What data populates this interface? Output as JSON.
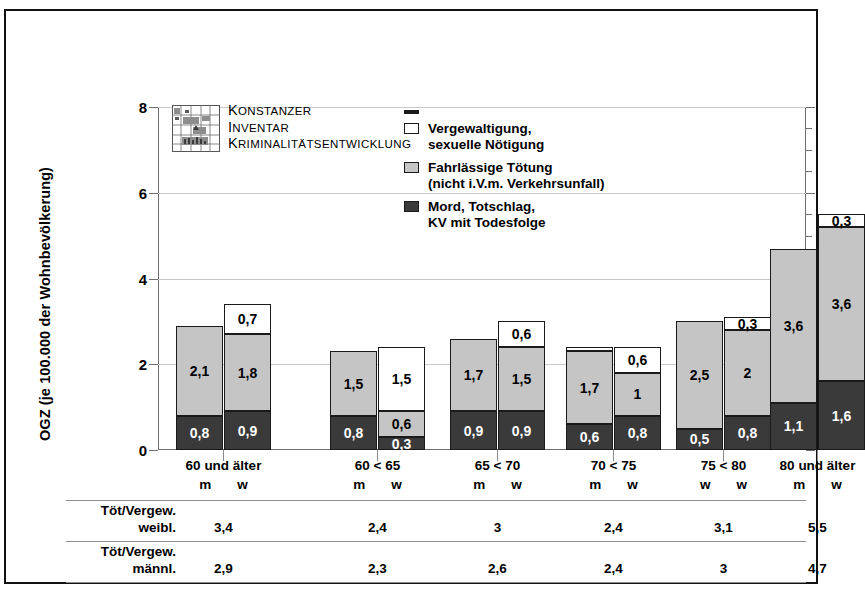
{
  "axis": {
    "y_title": "OGZ (je 100.000 der Wohnbevölkerung)",
    "y_ticks": [
      "0",
      "2",
      "4",
      "6",
      "8"
    ]
  },
  "kik_logo": {
    "line1_cap": "K",
    "line1_rest": "ONSTANZER",
    "line2_cap": "I",
    "line2_rest": "NVENTAR",
    "line3_cap": "K",
    "line3_rest": "RIMINALITÄTSENTWICKLUNG",
    "icon": "kik-map-logo"
  },
  "legend": {
    "items": [
      {
        "swatch": "dash-marker",
        "line1": "",
        "line2": ""
      },
      {
        "swatch": "white-square",
        "line1": "Vergewaltigung,",
        "line2": "sexuelle Nötigung"
      },
      {
        "swatch": "gray-square",
        "line1": "Fahrlässige Tötung",
        "line2": "(nicht i.V.m. Verkehrsunfall)"
      },
      {
        "swatch": "dark-square",
        "line1": "Mord, Totschlag,",
        "line2": "KV mit Todesfolge"
      }
    ]
  },
  "table": {
    "row1_label_line1": "Töt/Vergew.",
    "row1_label_line2": "weibl.",
    "row1_values": [
      "3,4",
      "2,4",
      "3",
      "2,4",
      "3,1",
      "5,5"
    ],
    "row2_label_line1": "Töt/Vergew.",
    "row2_label_line2": "männl.",
    "row2_values": [
      "2,9",
      "2,3",
      "2,6",
      "2,4",
      "3",
      "4,7"
    ]
  },
  "chart_data": {
    "type": "bar",
    "title": "",
    "xlabel": "",
    "ylabel": "OGZ (je 100.000 der Wohnbevölkerung)",
    "ylim": [
      0,
      8
    ],
    "yticks": [
      0,
      2,
      4,
      6,
      8
    ],
    "grid": true,
    "stacked": true,
    "legend_position": "inside-top",
    "series": [
      {
        "name": "Mord, Totschlag, KV mit Todesfolge",
        "color": "#3a3a3a"
      },
      {
        "name": "Fahrlässige Tötung (nicht i.V.m. Verkehrsunfall)",
        "color": "#c5c5c5"
      },
      {
        "name": "Vergewaltigung, sexuelle Nötigung",
        "color": "#ffffff"
      }
    ],
    "groups": [
      {
        "category": "60 und älter",
        "bars": [
          {
            "sex": "m",
            "total": 2.9,
            "segments": [
              {
                "series": "Mord, Totschlag, KV mit Todesfolge",
                "value": 0.8,
                "label": "0,8"
              },
              {
                "series": "Fahrlässige Tötung (nicht i.V.m. Verkehrsunfall)",
                "value": 2.1,
                "label": "2,1"
              }
            ]
          },
          {
            "sex": "w",
            "total": 3.4,
            "segments": [
              {
                "series": "Mord, Totschlag, KV mit Todesfolge",
                "value": 0.9,
                "label": "0,9"
              },
              {
                "series": "Fahrlässige Tötung (nicht i.V.m. Verkehrsunfall)",
                "value": 1.8,
                "label": "1,8"
              },
              {
                "series": "Vergewaltigung, sexuelle Nötigung",
                "value": 0.7,
                "label": "0,7"
              }
            ]
          }
        ]
      },
      {
        "category": "60 < 65",
        "bars": [
          {
            "sex": "m",
            "total": 2.3,
            "segments": [
              {
                "series": "Mord, Totschlag, KV mit Todesfolge",
                "value": 0.8,
                "label": "0,8"
              },
              {
                "series": "Fahrlässige Tötung (nicht i.V.m. Verkehrsunfall)",
                "value": 1.5,
                "label": "1,5"
              }
            ]
          },
          {
            "sex": "w",
            "total": 2.4,
            "segments": [
              {
                "series": "Mord, Totschlag, KV mit Todesfolge",
                "value": 0.3,
                "label": "0,3"
              },
              {
                "series": "Fahrlässige Tötung (nicht i.V.m. Verkehrsunfall)",
                "value": 0.6,
                "label": "0,6"
              },
              {
                "series": "Vergewaltigung, sexuelle Nötigung",
                "value": 1.5,
                "label": "1,5"
              }
            ]
          }
        ]
      },
      {
        "category": "65 < 70",
        "bars": [
          {
            "sex": "m",
            "total": 2.6,
            "segments": [
              {
                "series": "Mord, Totschlag, KV mit Todesfolge",
                "value": 0.9,
                "label": "0,9"
              },
              {
                "series": "Fahrlässige Tötung (nicht i.V.m. Verkehrsunfall)",
                "value": 1.7,
                "label": "1,7"
              }
            ]
          },
          {
            "sex": "w",
            "total": 3.0,
            "segments": [
              {
                "series": "Mord, Totschlag, KV mit Todesfolge",
                "value": 0.9,
                "label": "0,9"
              },
              {
                "series": "Fahrlässige Tötung (nicht i.V.m. Verkehrsunfall)",
                "value": 1.5,
                "label": "1,5"
              },
              {
                "series": "Vergewaltigung, sexuelle Nötigung",
                "value": 0.6,
                "label": "0,6"
              }
            ]
          }
        ]
      },
      {
        "category": "70 < 75",
        "bars": [
          {
            "sex": "m",
            "total": 2.4,
            "segments": [
              {
                "series": "Mord, Totschlag, KV mit Todesfolge",
                "value": 0.6,
                "label": "0,6"
              },
              {
                "series": "Fahrlässige Tötung (nicht i.V.m. Verkehrsunfall)",
                "value": 1.7,
                "label": "1,7"
              },
              {
                "series": "Vergewaltigung, sexuelle Nötigung",
                "value": 0.1,
                "label": ""
              }
            ]
          },
          {
            "sex": "w",
            "total": 2.4,
            "segments": [
              {
                "series": "Mord, Totschlag, KV mit Todesfolge",
                "value": 0.8,
                "label": "0,8"
              },
              {
                "series": "Fahrlässige Tötung (nicht i.V.m. Verkehrsunfall)",
                "value": 1.0,
                "label": "1"
              },
              {
                "series": "Vergewaltigung, sexuelle Nötigung",
                "value": 0.6,
                "label": "0,6"
              }
            ]
          }
        ]
      },
      {
        "category": "75 < 80",
        "bars": [
          {
            "sex": "w",
            "total": 3.0,
            "segments": [
              {
                "series": "Mord, Totschlag, KV mit Todesfolge",
                "value": 0.5,
                "label": "0,5"
              },
              {
                "series": "Fahrlässige Tötung (nicht i.V.m. Verkehrsunfall)",
                "value": 2.5,
                "label": "2,5"
              }
            ]
          },
          {
            "sex": "w",
            "total": 3.1,
            "segments": [
              {
                "series": "Mord, Totschlag, KV mit Todesfolge",
                "value": 0.8,
                "label": "0,8"
              },
              {
                "series": "Fahrlässige Tötung (nicht i.V.m. Verkehrsunfall)",
                "value": 2.0,
                "label": "2"
              },
              {
                "series": "Vergewaltigung, sexuelle Nötigung",
                "value": 0.3,
                "label": "0,3"
              }
            ]
          }
        ]
      },
      {
        "category": "80 und älter",
        "bars": [
          {
            "sex": "m",
            "total": 4.7,
            "segments": [
              {
                "series": "Mord, Totschlag, KV mit Todesfolge",
                "value": 1.1,
                "label": "1,1"
              },
              {
                "series": "Fahrlässige Tötung (nicht i.V.m. Verkehrsunfall)",
                "value": 3.6,
                "label": "3,6"
              }
            ]
          },
          {
            "sex": "w",
            "total": 5.5,
            "segments": [
              {
                "series": "Mord, Totschlag, KV mit Todesfolge",
                "value": 1.6,
                "label": "1,6"
              },
              {
                "series": "Fahrlässige Tötung (nicht i.V.m. Verkehrsunfall)",
                "value": 3.6,
                "label": "3,6"
              },
              {
                "series": "Vergewaltigung, sexuelle Nötigung",
                "value": 0.3,
                "label": "0,3"
              }
            ]
          }
        ]
      }
    ]
  }
}
